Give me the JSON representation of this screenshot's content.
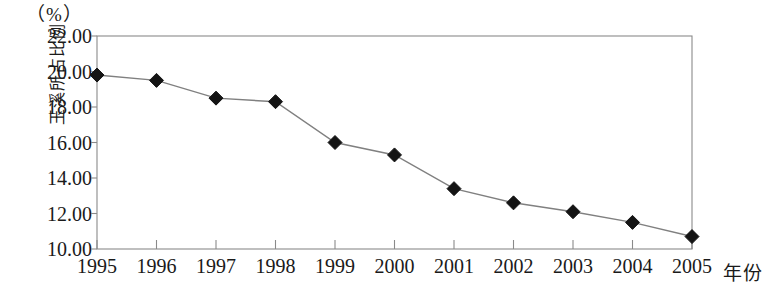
{
  "chart_data": {
    "type": "line",
    "title": "",
    "subtitle": "",
    "xlabel": "年份",
    "ylabel": "玉溪所占比例",
    "unit_label": "（%）",
    "categories": [
      "1995",
      "1996",
      "1997",
      "1998",
      "1999",
      "2000",
      "2001",
      "2002",
      "2003",
      "2004",
      "2005"
    ],
    "values": [
      19.8,
      19.5,
      18.5,
      18.3,
      16.0,
      15.3,
      13.4,
      12.6,
      12.1,
      11.5,
      10.7
    ],
    "series": [
      {
        "name": "玉溪所占比例",
        "values": [
          19.8,
          19.5,
          18.5,
          18.3,
          16.0,
          15.3,
          13.4,
          12.6,
          12.1,
          11.5,
          10.7
        ]
      }
    ],
    "ylim": [
      10.0,
      22.0
    ],
    "ytick_step": 2.0,
    "ytick_labels": [
      "22.00",
      "20.00",
      "18.00",
      "16.00",
      "14.00",
      "12.00",
      "10.00"
    ],
    "ytick_values": [
      22.0,
      20.0,
      18.0,
      16.0,
      14.0,
      12.0,
      10.0
    ],
    "xtick_labels": [
      "1995",
      "1996",
      "1997",
      "1998",
      "1999",
      "2000",
      "2001",
      "2002",
      "2003",
      "2004",
      "2005"
    ],
    "grid": false,
    "legend": false,
    "legend_position": "none",
    "marker": "diamond",
    "line_color": "#808080",
    "marker_color": "#141414",
    "axis_color": "#8a8a8a"
  },
  "axis": {
    "unit_label": "（%）",
    "y_title": "玉溪所占比例",
    "x_title": "年份"
  }
}
